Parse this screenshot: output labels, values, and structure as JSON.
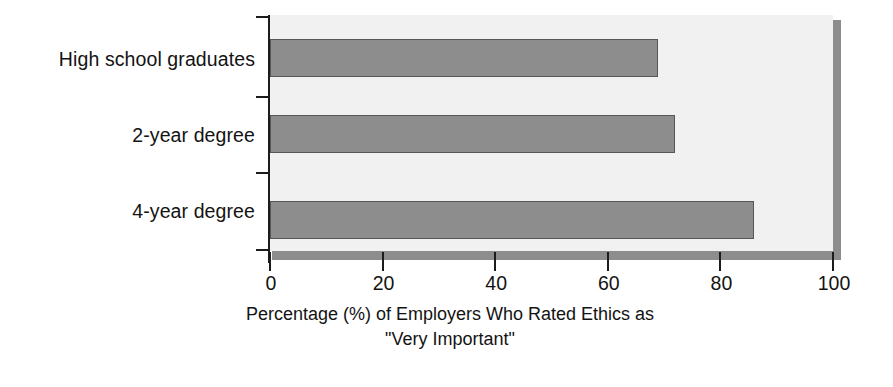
{
  "chart_data": {
    "type": "bar",
    "orientation": "horizontal",
    "title": "",
    "subtitle": "",
    "categories": [
      "High school graduates",
      "2-year degree",
      "4-year degree"
    ],
    "values": [
      69,
      72,
      86
    ],
    "xlabel_line1": "Percentage (%) of Employers Who Rated Ethics as",
    "xlabel_line2": "\"Very Important\"",
    "ylabel": "",
    "xlim": [
      0,
      100
    ],
    "xticks": [
      0,
      20,
      40,
      60,
      80,
      100
    ],
    "xtick_labels": [
      "0",
      "20",
      "40",
      "60",
      "80",
      "100"
    ],
    "grid": false,
    "legend": null,
    "colors": {
      "bar_fill": "#8d8d8d",
      "bar_border": "#565656",
      "plot_background": "#f1f1f1",
      "shadow": "#8d8d8d",
      "axis": "#1c1c1c",
      "text": "#131313",
      "page_background": "#ffffff"
    }
  }
}
